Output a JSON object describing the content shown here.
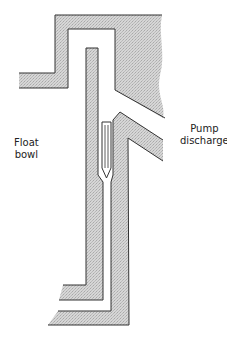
{
  "diagram": {
    "type": "carburetor-pump-discharge-cross-section",
    "labels": {
      "float_bowl": [
        "Float",
        "bowl"
      ],
      "pump_discharge": [
        "Pump",
        "discharge"
      ]
    },
    "colors": {
      "fill": "#cfcfcf",
      "line": "#333333",
      "background": "#ffffff"
    }
  }
}
